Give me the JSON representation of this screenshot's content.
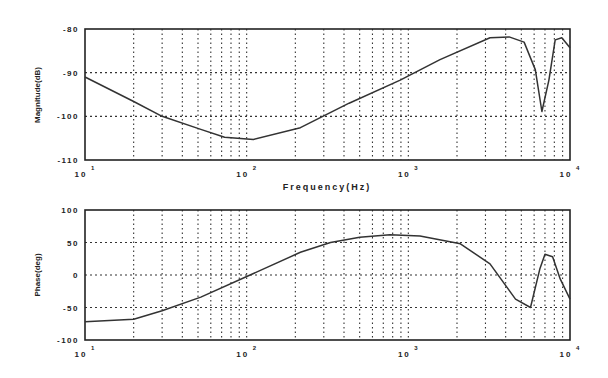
{
  "chart_data": [
    {
      "type": "line",
      "title": "",
      "xlabel": "Frequency(Hz)",
      "ylabel": "Magnitude(dB)",
      "xscale": "log",
      "xlim": [
        10,
        10000
      ],
      "ylim": [
        -110,
        -80
      ],
      "yticks": [
        -80,
        -90,
        -100,
        -110
      ],
      "ytick_labels": [
        "-80",
        "-90",
        "-100",
        "-110"
      ],
      "xticks": [
        10,
        100,
        1000,
        10000
      ],
      "xtick_labels": [
        {
          "base": "10",
          "exp": "1"
        },
        {
          "base": "10",
          "exp": "2"
        },
        {
          "base": "10",
          "exp": "3"
        },
        {
          "base": "10",
          "exp": "4"
        }
      ],
      "grid": true,
      "series": [
        {
          "name": "Magnitude",
          "x": [
            10,
            20,
            30,
            52,
            73,
            110,
            215,
            430,
            890,
            1570,
            3200,
            4200,
            5200,
            6100,
            6700,
            7400,
            8100,
            8900,
            10000
          ],
          "y": [
            -91,
            -96.6,
            -100,
            -103,
            -104.8,
            -105.3,
            -102.6,
            -97,
            -91.7,
            -87,
            -82,
            -81.8,
            -83,
            -89.3,
            -98.9,
            -91.7,
            -82.5,
            -82,
            -84.3
          ]
        }
      ]
    },
    {
      "type": "line",
      "title": "",
      "xlabel": "",
      "ylabel": "Phase(deg)",
      "xscale": "log",
      "xlim": [
        10,
        10000
      ],
      "ylim": [
        -100,
        100
      ],
      "yticks": [
        100,
        50,
        0,
        -50,
        -100
      ],
      "ytick_labels": [
        "100",
        "50",
        "0",
        "-50",
        "-100"
      ],
      "xticks": [
        10,
        100,
        1000,
        10000
      ],
      "xtick_labels": [
        {
          "base": "10",
          "exp": "1"
        },
        {
          "base": "10",
          "exp": "2"
        },
        {
          "base": "10",
          "exp": "3"
        },
        {
          "base": "10",
          "exp": "4"
        }
      ],
      "grid": true,
      "series": [
        {
          "name": "Phase",
          "x": [
            10,
            20,
            30,
            52,
            105,
            215,
            330,
            500,
            770,
            1180,
            2100,
            3200,
            4600,
            5700,
            6500,
            7000,
            7800,
            8700,
            10000
          ],
          "y": [
            -72,
            -68,
            -55,
            -34,
            0,
            35,
            50,
            58,
            62,
            60,
            48,
            17,
            -37,
            -50,
            9,
            32,
            28,
            -6,
            -37
          ]
        }
      ]
    }
  ],
  "plots": {
    "top": {
      "ylabel": "Magnitude(dB)",
      "xlabel": "Frequency(Hz)"
    },
    "bottom": {
      "ylabel": "Phase(deg)"
    }
  }
}
